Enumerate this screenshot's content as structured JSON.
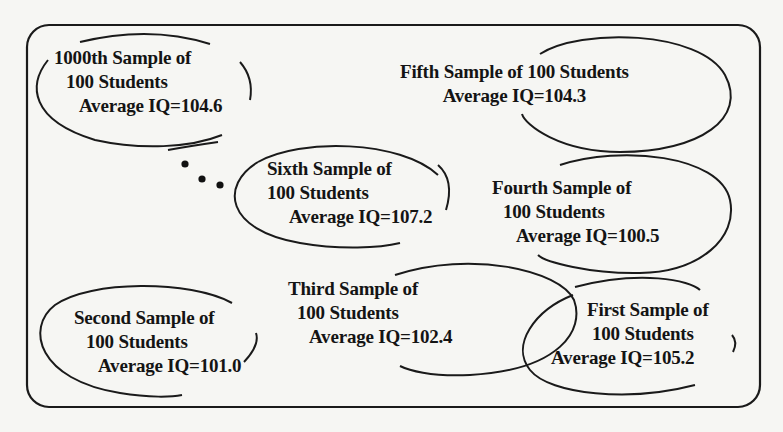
{
  "diagram": {
    "type": "sampling-illustration",
    "ellipsis_glyph": "• • •",
    "samples": [
      {
        "id": "first",
        "title": "First Sample of",
        "subtitle": "100 Students",
        "stat_label": "Average IQ",
        "value": "105.2",
        "line3": "Average IQ=105.2"
      },
      {
        "id": "second",
        "title": "Second Sample of",
        "subtitle": "100 Students",
        "stat_label": "Average IQ",
        "value": "101.0",
        "line3": "Average IQ=101.0"
      },
      {
        "id": "third",
        "title": "Third Sample of",
        "subtitle": "100 Students",
        "stat_label": "Average IQ",
        "value": "102.4",
        "line3": "Average IQ=102.4"
      },
      {
        "id": "fourth",
        "title": "Fourth Sample of",
        "subtitle": "100 Students",
        "stat_label": "Average IQ",
        "value": "100.5",
        "line3": "Average IQ=100.5"
      },
      {
        "id": "fifth",
        "title": "Fifth Sample of 100 Students",
        "subtitle": "",
        "stat_label": "Average IQ",
        "value": "104.3",
        "line3": "Average IQ=104.3"
      },
      {
        "id": "sixth",
        "title": "Sixth Sample of",
        "subtitle": "100 Students",
        "stat_label": "Average IQ",
        "value": "107.2",
        "line3": "Average IQ=107.2"
      },
      {
        "id": "1000th",
        "title": "1000th Sample of",
        "subtitle": "100 Students",
        "stat_label": "Average IQ",
        "value": "104.6",
        "line3": "Average IQ=104.6"
      }
    ]
  },
  "colors": {
    "background": "#f6f6f3",
    "stroke": "#1a1a1a",
    "text": "#141414"
  }
}
